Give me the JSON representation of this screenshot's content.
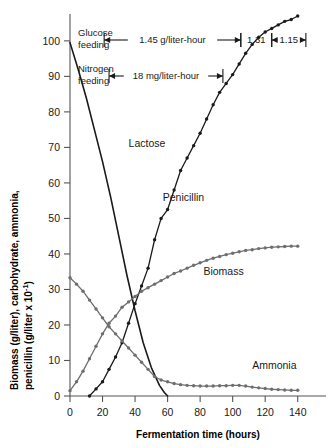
{
  "chart_data": {
    "type": "line",
    "title": "",
    "xlabel": "Fermentation time (hours)",
    "ylabel": "Biomass (g/liter), carbohydrate, ammonia,",
    "ylabel_line2": "penicillin (g/liter x 10",
    "ylabel_exp": "-1",
    "ylabel_close": ")",
    "xlim": [
      0,
      150
    ],
    "ylim": [
      0,
      107
    ],
    "xticks": [
      0,
      20,
      40,
      60,
      80,
      100,
      120,
      140
    ],
    "yticks": [
      0,
      10,
      20,
      30,
      40,
      50,
      60,
      70,
      80,
      90,
      100
    ],
    "grid": false,
    "legend_position": "inline-labels",
    "series": [
      {
        "name": "Lactose",
        "color": "#1a1a1a",
        "label_x": 36,
        "label_y": 70,
        "markers": false,
        "x": [
          0,
          5,
          10,
          15,
          20,
          25,
          30,
          35,
          40,
          45,
          50,
          55,
          58,
          60
        ],
        "y": [
          99.5,
          92,
          84,
          75,
          66,
          56,
          45,
          34,
          24,
          15,
          8,
          3,
          1,
          0
        ]
      },
      {
        "name": "Penicillin",
        "color": "#1a1a1a",
        "label_x": 57,
        "label_y": 55,
        "markers": true,
        "x": [
          12,
          16,
          20,
          24,
          28,
          32,
          36,
          40,
          44,
          48,
          52,
          56,
          60,
          64,
          68,
          72,
          76,
          80,
          84,
          88,
          92,
          96,
          100,
          104,
          108,
          112,
          116,
          120,
          124,
          128,
          132,
          136,
          140
        ],
        "y": [
          0,
          2,
          4,
          7.5,
          11,
          15,
          20.5,
          26,
          31,
          36,
          44,
          50,
          52.5,
          58,
          63.5,
          67,
          70.5,
          74,
          78,
          82,
          85.5,
          88,
          90.5,
          93.5,
          96.5,
          99,
          101,
          102.5,
          103.5,
          104.5,
          105.5,
          106,
          107
        ]
      },
      {
        "name": "Biomass",
        "color": "#6e6e6e",
        "label_x": 82,
        "label_y": 34,
        "markers": true,
        "x": [
          0,
          4,
          8,
          12,
          16,
          20,
          24,
          28,
          32,
          36,
          40,
          44,
          48,
          52,
          56,
          60,
          64,
          68,
          72,
          76,
          80,
          84,
          88,
          92,
          96,
          100,
          104,
          108,
          112,
          116,
          120,
          124,
          128,
          132,
          136,
          140
        ],
        "y": [
          1.5,
          4,
          7,
          10.5,
          14,
          17.5,
          20.5,
          22.5,
          25,
          26.5,
          28,
          29.5,
          30.5,
          31.5,
          32.5,
          33.5,
          34.5,
          35.2,
          36,
          36.8,
          37.5,
          38.2,
          38.8,
          39.3,
          39.8,
          40.2,
          40.6,
          41,
          41.2,
          41.5,
          41.7,
          41.9,
          42,
          42.1,
          42.2,
          42.2
        ]
      },
      {
        "name": "Ammonia",
        "color": "#6e6e6e",
        "label_x": 112,
        "label_y": 7.5,
        "markers": true,
        "x": [
          0,
          4,
          8,
          12,
          16,
          20,
          24,
          28,
          32,
          36,
          40,
          44,
          48,
          52,
          56,
          60,
          64,
          68,
          72,
          76,
          80,
          84,
          88,
          92,
          96,
          100,
          104,
          108,
          112,
          116,
          120,
          124,
          128,
          132,
          136,
          140
        ],
        "y": [
          33.3,
          31.5,
          29.5,
          27,
          24.5,
          22,
          19.5,
          17.5,
          15.5,
          13.5,
          11.5,
          9.5,
          7.5,
          5.5,
          4.5,
          4,
          3.5,
          3.2,
          3,
          2.9,
          2.8,
          2.8,
          2.8,
          2.9,
          2.9,
          3,
          3,
          2.8,
          2.5,
          2.3,
          2.1,
          1.9,
          1.8,
          1.7,
          1.6,
          1.6
        ]
      }
    ],
    "annotations": [
      {
        "id": "glucose-feeding",
        "label_line1": "Glucose",
        "label_line2": "feeding",
        "spans": [
          {
            "id": "span-1",
            "text": "1.45 g/liter-hour",
            "x_start": 21,
            "x_end": 105
          },
          {
            "id": "span-2",
            "text": "1.31",
            "x_start": 105,
            "x_end": 124
          },
          {
            "id": "span-3",
            "text": "1.15",
            "x_start": 124,
            "x_end": 145
          }
        ]
      },
      {
        "id": "nitrogen-feeding",
        "label_line1": "Nitrogen",
        "label_line2": "feeding",
        "spans": [
          {
            "id": "span-n1",
            "text": "18 mg/liter-hour",
            "x_start": 24,
            "x_end": 94
          }
        ]
      }
    ]
  }
}
